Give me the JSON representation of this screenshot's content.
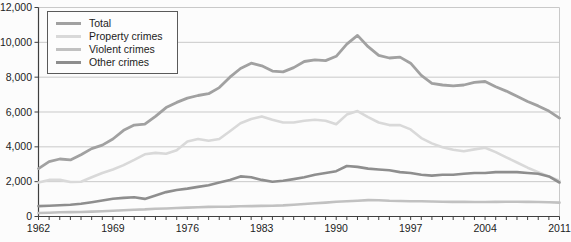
{
  "figure": {
    "background": "#fcfcfc"
  },
  "legend": {
    "items": [
      {
        "label": "Total",
        "color": "#a1a1a1"
      },
      {
        "label": "Property crimes",
        "color": "#d9d9d9"
      },
      {
        "label": "Violent crimes",
        "color": "#c1c1c1"
      },
      {
        "label": "Other crimes",
        "color": "#8e8e8e"
      }
    ]
  },
  "chart_data": {
    "type": "line",
    "title": "",
    "xlabel": "",
    "ylabel": "",
    "ylim": [
      0,
      12000
    ],
    "grid": true,
    "legend_position": "top-left",
    "axis_color": "#3f3f3f",
    "grid_color": "#c9c9c9",
    "text_color": "#1c1c1c",
    "y_ticks": [
      0,
      2000,
      4000,
      6000,
      8000,
      10000,
      12000
    ],
    "y_tick_labels": [
      "0",
      "2,000",
      "4,000",
      "6,000",
      "8,000",
      "10,000",
      "12,000"
    ],
    "x_labeled_ticks": [
      1962,
      1969,
      1976,
      1983,
      1990,
      1997,
      2004,
      2011
    ],
    "x_tick_labels": [
      "1962",
      "1969",
      "1976",
      "1983",
      "1990",
      "1997",
      "2004",
      "2011"
    ],
    "x": [
      1962,
      1963,
      1964,
      1965,
      1966,
      1967,
      1968,
      1969,
      1970,
      1971,
      1972,
      1973,
      1974,
      1975,
      1976,
      1977,
      1978,
      1979,
      1980,
      1981,
      1982,
      1983,
      1984,
      1985,
      1986,
      1987,
      1988,
      1989,
      1990,
      1991,
      1992,
      1993,
      1994,
      1995,
      1996,
      1997,
      1998,
      1999,
      2000,
      2001,
      2002,
      2003,
      2004,
      2005,
      2006,
      2007,
      2008,
      2009,
      2010,
      2011
    ],
    "series": [
      {
        "name": "Total",
        "color": "#a1a1a1",
        "width": 2.8,
        "values": [
          2750,
          3150,
          3300,
          3250,
          3550,
          3900,
          4100,
          4450,
          4950,
          5250,
          5300,
          5750,
          6250,
          6550,
          6800,
          6950,
          7050,
          7400,
          8000,
          8500,
          8800,
          8650,
          8350,
          8300,
          8550,
          8900,
          9000,
          8950,
          9200,
          9900,
          10400,
          9750,
          9250,
          9100,
          9150,
          8800,
          8100,
          7650,
          7550,
          7500,
          7550,
          7700,
          7750,
          7450,
          7200,
          6900,
          6600,
          6350,
          6050,
          5650
        ]
      },
      {
        "name": "Property crimes",
        "color": "#d9d9d9",
        "width": 2.6,
        "values": [
          1950,
          2100,
          2100,
          1980,
          2000,
          2250,
          2500,
          2700,
          2950,
          3250,
          3570,
          3650,
          3600,
          3800,
          4300,
          4450,
          4350,
          4450,
          4900,
          5350,
          5600,
          5750,
          5550,
          5400,
          5400,
          5500,
          5550,
          5500,
          5300,
          5850,
          6050,
          5700,
          5400,
          5250,
          5250,
          5000,
          4500,
          4200,
          3980,
          3830,
          3750,
          3850,
          3950,
          3700,
          3400,
          3100,
          2800,
          2550,
          2300,
          2050
        ]
      },
      {
        "name": "Violent crimes",
        "color": "#c1c1c1",
        "width": 2.6,
        "values": [
          200,
          220,
          240,
          250,
          260,
          280,
          300,
          330,
          360,
          390,
          410,
          440,
          460,
          490,
          510,
          530,
          550,
          560,
          570,
          590,
          600,
          610,
          620,
          640,
          680,
          720,
          760,
          800,
          850,
          880,
          910,
          940,
          930,
          900,
          890,
          880,
          870,
          860,
          850,
          840,
          840,
          830,
          830,
          840,
          850,
          850,
          840,
          830,
          820,
          800
        ]
      },
      {
        "name": "Other crimes",
        "color": "#8e8e8e",
        "width": 2.6,
        "values": [
          600,
          620,
          650,
          680,
          730,
          820,
          920,
          1020,
          1070,
          1100,
          1010,
          1200,
          1400,
          1520,
          1600,
          1700,
          1800,
          1950,
          2100,
          2300,
          2250,
          2100,
          2000,
          2050,
          2150,
          2250,
          2400,
          2500,
          2600,
          2900,
          2850,
          2750,
          2700,
          2650,
          2550,
          2500,
          2400,
          2350,
          2400,
          2400,
          2450,
          2500,
          2500,
          2550,
          2550,
          2550,
          2500,
          2450,
          2300,
          1950
        ]
      }
    ]
  }
}
